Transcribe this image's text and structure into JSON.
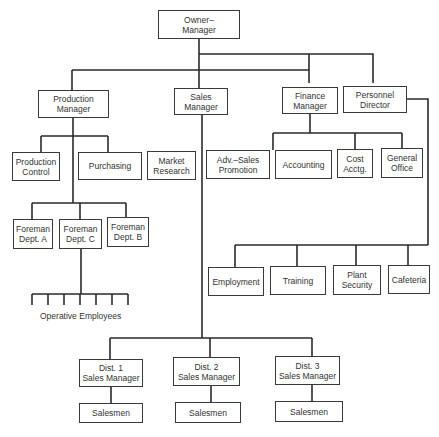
{
  "diagram": {
    "type": "organization-chart",
    "nodes": {
      "owner": {
        "lines": [
          "Owner–",
          "Manager"
        ]
      },
      "production_manager": {
        "lines": [
          "Production",
          "Manager"
        ]
      },
      "sales_manager": {
        "lines": [
          "Sales",
          "Manager"
        ]
      },
      "finance_manager": {
        "lines": [
          "Finance",
          "Manager"
        ]
      },
      "personnel_director": {
        "lines": [
          "Personnel",
          "Director"
        ]
      },
      "production_control": {
        "lines": [
          "Production",
          "Control"
        ]
      },
      "purchasing": {
        "lines": [
          "Purchasing"
        ]
      },
      "market_research": {
        "lines": [
          "Market",
          "Research"
        ]
      },
      "adv_sales_promotion": {
        "lines": [
          "Adv.–Sales",
          "Promotion"
        ]
      },
      "accounting": {
        "lines": [
          "Accounting"
        ]
      },
      "cost_acctg": {
        "lines": [
          "Cost",
          "Acctg."
        ]
      },
      "general_office": {
        "lines": [
          "General",
          "Office"
        ]
      },
      "foreman_a": {
        "lines": [
          "Foreman",
          "Dept.  A"
        ]
      },
      "foreman_c": {
        "lines": [
          "Foreman",
          "Dept.  C"
        ]
      },
      "foreman_b": {
        "lines": [
          "Foreman",
          "Dept.  B"
        ]
      },
      "employment": {
        "lines": [
          "Employment"
        ]
      },
      "training": {
        "lines": [
          "Training"
        ]
      },
      "plant_security": {
        "lines": [
          "Plant",
          "Security"
        ]
      },
      "cafeteria": {
        "lines": [
          "Cafeteria"
        ]
      },
      "dist1": {
        "lines": [
          "Dist.  1",
          "Sales Manager"
        ]
      },
      "dist2": {
        "lines": [
          "Dist.  2",
          "Sales Manager"
        ]
      },
      "dist3": {
        "lines": [
          "Dist.  3",
          "Sales Manager"
        ]
      },
      "salesmen1": {
        "lines": [
          "Salesmen"
        ]
      },
      "salesmen2": {
        "lines": [
          "Salesmen"
        ]
      },
      "salesmen3": {
        "lines": [
          "Salesmen"
        ]
      }
    },
    "operative_employees_label": "Operative  Employees",
    "colors": {
      "line": "#2a2a2a",
      "box_border": "#3a3a3a",
      "text": "#333333",
      "background": "#ffffff"
    }
  }
}
